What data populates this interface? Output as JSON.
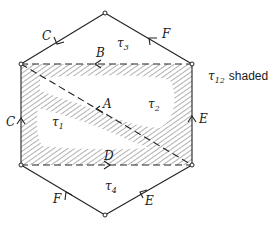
{
  "figure": {
    "vertices": {
      "top": [
        105,
        13
      ],
      "top_left": [
        21,
        64
      ],
      "top_right": [
        192,
        64
      ],
      "bottom_left": [
        21,
        165
      ],
      "bottom_right": [
        192,
        165
      ],
      "bottom": [
        105,
        215
      ]
    },
    "edge_labels": {
      "top_left_edge": "C",
      "top_right_edge": "F",
      "rect_top": "B",
      "diagonal": "A",
      "rect_left": "C",
      "rect_right": "E",
      "rect_bottom": "D",
      "bottom_left_edge": "F",
      "bottom_right_edge": "E"
    },
    "regions": {
      "tau3": {
        "symbol": "τ",
        "sub": "3"
      },
      "tau2": {
        "symbol": "τ",
        "sub": "2"
      },
      "tau1": {
        "symbol": "τ",
        "sub": "1"
      },
      "tau4": {
        "symbol": "τ",
        "sub": "4"
      }
    },
    "annotation": {
      "symbol": "τ",
      "sub": "12",
      "text": "shaded"
    },
    "colors": {
      "line": "#222222",
      "hatch": "#555555",
      "background": "#ffffff"
    }
  }
}
